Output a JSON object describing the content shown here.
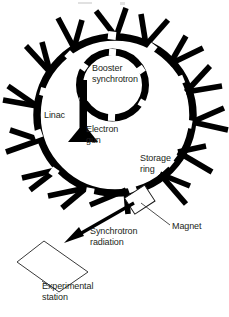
{
  "figure": {
    "colors": {
      "ink": "#000000",
      "text": "#231f20",
      "background": "#ffffff",
      "outline": "#3a3a3a"
    },
    "labels": {
      "booster_synchrotron": "Booster\nsynchrotron",
      "linac": "Linac",
      "electron_gun": "Electron\ngun",
      "storage_ring": "Storage\nring",
      "magnet": "Magnet",
      "synchrotron_radiation": "Synchrotron\nradiation",
      "experimental_station": "Experimental\nstation"
    },
    "components": [
      {
        "name": "storage-ring",
        "shape": "thick-circle-with-gaps",
        "cx": 115,
        "cy": 115,
        "r": 78
      },
      {
        "name": "booster-synchrotron",
        "shape": "thick-circle-with-gaps",
        "cx": 113,
        "cy": 85,
        "r": 33
      },
      {
        "name": "linac",
        "shape": "vertical-bar",
        "x": 83,
        "y_top": 85,
        "y_bottom": 137
      },
      {
        "name": "electron-gun",
        "shape": "flared-triangle",
        "x": 83,
        "y": 137
      },
      {
        "name": "bending-magnet",
        "shape": "outlined-rectangle",
        "x": 132,
        "y": 196,
        "rotation_deg": -35
      },
      {
        "name": "synchrotron-radiation-beam",
        "shape": "arrow",
        "from_x": 133,
        "from_y": 205,
        "to_x": 70,
        "to_y": 240
      },
      {
        "name": "experimental-station",
        "shape": "rotated-square-outline",
        "cx": 57,
        "cy": 265,
        "size": 52,
        "rotation_deg": -38
      },
      {
        "name": "beamline-spokes",
        "shape": "radial-branches",
        "count": 14
      }
    ],
    "beamline_spokes_deg": [
      18,
      36,
      58,
      80,
      104,
      126,
      148,
      170,
      196,
      214,
      236,
      260,
      300,
      330
    ]
  }
}
